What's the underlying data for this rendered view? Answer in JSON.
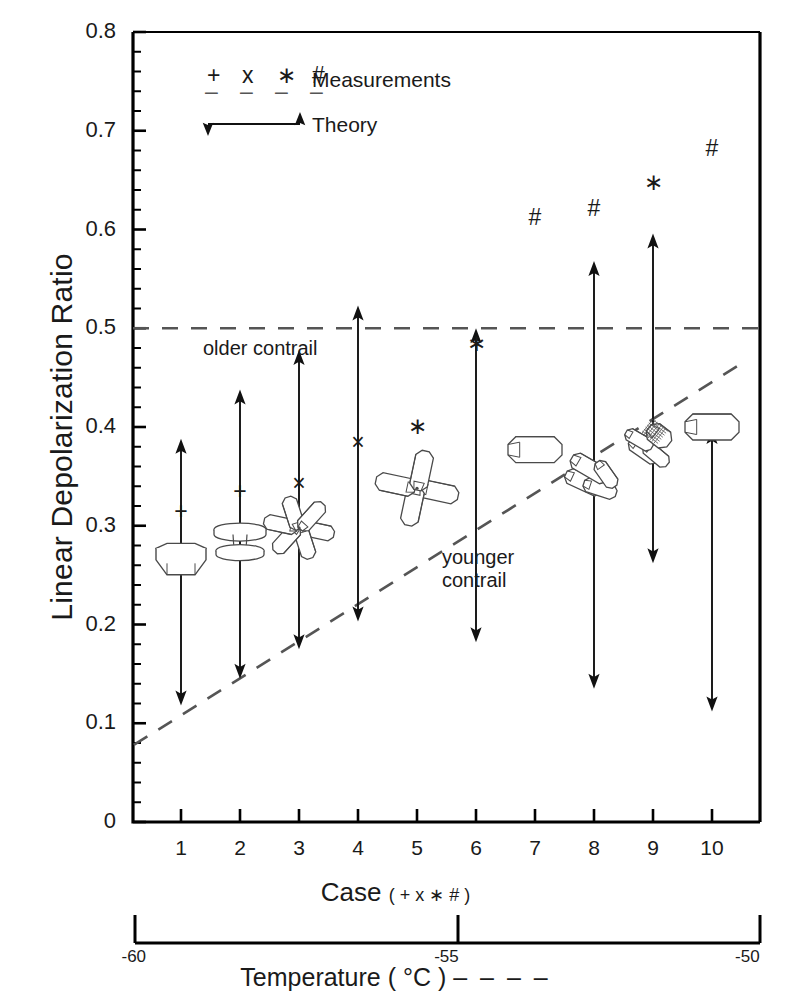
{
  "chart_data": {
    "type": "scatter",
    "title": "",
    "xlabel": "Case",
    "xlabel_suffix": "( + x ∗ # )",
    "ylabel": "Linear Depolarization Ratio",
    "ylim": [
      0,
      0.8
    ],
    "ytick_labels": [
      "0.8",
      "0.7",
      "0.6",
      "0.5",
      "0.4",
      "0.3",
      "0.2",
      "0.1",
      "0"
    ],
    "ytick_values": [
      0.8,
      0.7,
      0.6,
      0.5,
      0.4,
      0.3,
      0.2,
      0.1,
      0
    ],
    "yminor_step": 0.02,
    "grid": false,
    "categories": [
      "1",
      "2",
      "3",
      "4",
      "5",
      "6",
      "7",
      "8",
      "9",
      "10"
    ],
    "secondary_axis": {
      "label": "Temperature ( °C )",
      "label_dash": "– – – –",
      "ticks": [
        {
          "label": "-60",
          "case": 0.2
        },
        {
          "label": "-55",
          "case": 5.5
        },
        {
          "label": "-50",
          "case": 10.6
        }
      ],
      "range": [
        -60,
        -50
      ]
    },
    "measurements": [
      {
        "case": 1,
        "symbol": "+",
        "value": 0.312
      },
      {
        "case": 2,
        "symbol": "+",
        "value": 0.332
      },
      {
        "case": 3,
        "symbol": "×",
        "value": 0.34
      },
      {
        "case": 4,
        "symbol": "×",
        "value": 0.382
      },
      {
        "case": 5,
        "symbol": "∗",
        "value": 0.398
      },
      {
        "case": 6,
        "symbol": "∗",
        "value": 0.482
      },
      {
        "case": 7,
        "symbol": "#",
        "value": 0.61
      },
      {
        "case": 8,
        "symbol": "#",
        "value": 0.619
      },
      {
        "case": 9,
        "symbol": "∗",
        "value": 0.645
      },
      {
        "case": 10,
        "symbol": "#",
        "value": 0.68
      }
    ],
    "theory_ranges": [
      {
        "case": 1,
        "low": 0.118,
        "high": 0.388
      },
      {
        "case": 2,
        "low": 0.145,
        "high": 0.438
      },
      {
        "case": 3,
        "low": 0.175,
        "high": 0.478
      },
      {
        "case": 4,
        "low": 0.203,
        "high": 0.523
      },
      {
        "case": 5,
        "low": 0.332,
        "high": 0.34
      },
      {
        "case": 6,
        "low": 0.182,
        "high": 0.5
      },
      {
        "case": 7,
        "low": 0.372,
        "high": 0.382
      },
      {
        "case": 8,
        "low": 0.135,
        "high": 0.568
      },
      {
        "case": 9,
        "low": 0.262,
        "high": 0.596
      },
      {
        "case": 10,
        "low": 0.112,
        "high": 0.398
      }
    ],
    "reference_lines": [
      {
        "name": "older-contrail",
        "style": "dashed",
        "type": "horizontal",
        "value": 0.5
      },
      {
        "name": "younger-contrail",
        "style": "dashed",
        "type": "sloped",
        "from": {
          "case": 0.2,
          "value": 0.078
        },
        "to": {
          "case": 10.6,
          "value": 0.468
        }
      }
    ],
    "crystal_habits": [
      {
        "case": 1,
        "habit": "hexagonal-plate",
        "value": 0.268
      },
      {
        "case": 2,
        "habit": "capped-column",
        "value": 0.285
      },
      {
        "case": 3,
        "habit": "bullet-rosette",
        "value": 0.298
      },
      {
        "case": 4,
        "habit": "none",
        "value": null
      },
      {
        "case": 5,
        "habit": "bullet-rosette-4arm",
        "value": 0.338
      },
      {
        "case": 6,
        "habit": "none",
        "value": null
      },
      {
        "case": 7,
        "habit": "solid-column",
        "value": 0.377
      },
      {
        "case": 8,
        "habit": "column-aggregate",
        "value": 0.352
      },
      {
        "case": 9,
        "habit": "hollow-column-aggregate",
        "value": 0.383
      },
      {
        "case": 10,
        "habit": "solid-column",
        "value": 0.4
      }
    ]
  },
  "legend": {
    "measurements_symbols": [
      "+",
      "x",
      "∗",
      "#"
    ],
    "measurements_dashes": [
      "–",
      "–",
      "–",
      "–"
    ],
    "measurements_label": "Measurements",
    "theory_label": "Theory"
  },
  "annotations": {
    "older_contrail": "older contrail",
    "younger_contrail_line1": "younger",
    "younger_contrail_line2": "contrail"
  },
  "colors": {
    "ink": "#1a1a1a",
    "axis": "#000000",
    "dash": "#555555",
    "crystal_stroke": "#4a4a4a",
    "background": "#ffffff"
  }
}
